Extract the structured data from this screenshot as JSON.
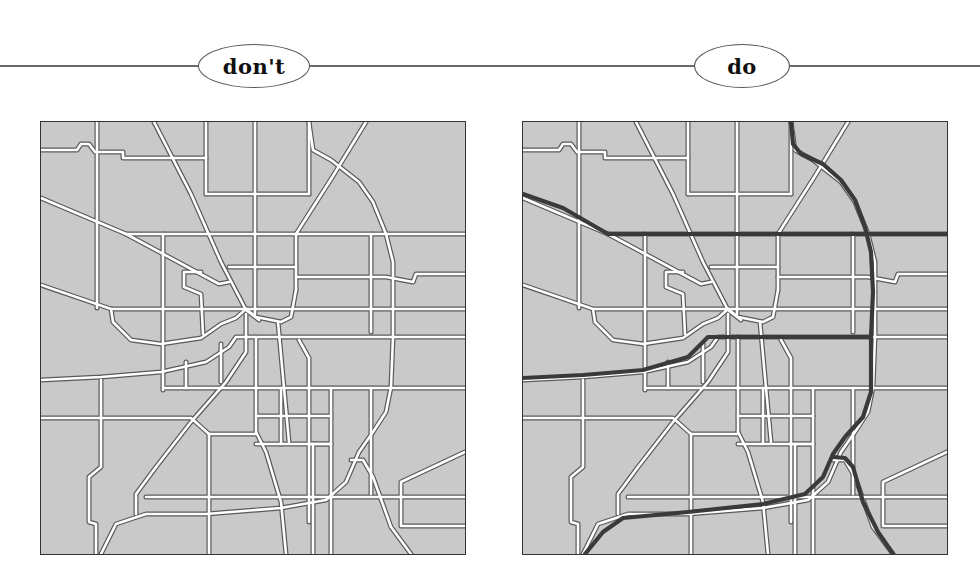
{
  "panels": [
    {
      "label": "don't",
      "description": "Street map showing only the local road network, no highways emphasized"
    },
    {
      "label": "do",
      "description": "Same street map with major highways emphasized as thick dark lines"
    }
  ],
  "colors": {
    "background": "#ffffff",
    "block_fill": "#c9c9c9",
    "road": "#ffffff",
    "road_edge": "#555555",
    "highway": "#3a3a3a",
    "frame": "#333333",
    "rule": "#6a6a6a"
  }
}
